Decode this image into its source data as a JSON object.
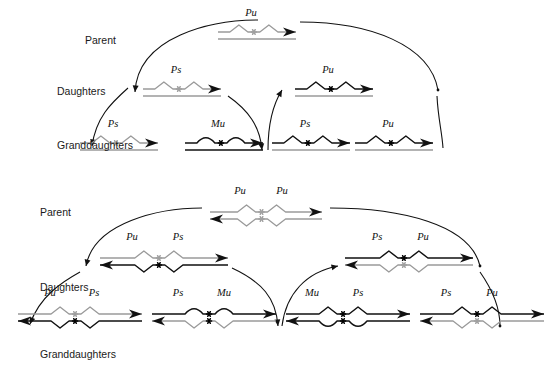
{
  "diagram": {
    "title_none": "",
    "colors": {
      "strand_dark": "#111111",
      "strand_light": "#9a9a9a",
      "background": "#ffffff",
      "text": "#1a1a1a"
    },
    "legend_symbols": {
      "Pu": "unmethylated-purine-site",
      "Ps": "methylated-site",
      "Mu": "mutated-site",
      "asterisk_dark": "black-asterisk-marker",
      "asterisk_light": "gray-asterisk-marker"
    }
  },
  "panels": [
    {
      "id": "panel-top",
      "row_labels": [
        {
          "text": "Parent",
          "x": 85,
          "y": 44
        },
        {
          "text": "Daughters",
          "x": 57,
          "y": 95
        },
        {
          "text": "Granddaughters",
          "x": 57,
          "y": 149
        }
      ],
      "generations": [
        {
          "name": "parent",
          "molecules": [
            {
              "id": "p1-parent-a",
              "x": 218,
              "y": 32,
              "width": 78,
              "labels": [
                {
                  "text": "Pu",
                  "dx": 33,
                  "dy": -16,
                  "tone": "dark"
                }
              ],
              "top_strand": {
                "tone": "light",
                "shape": "peaks",
                "marker": "light",
                "arrow": "right"
              },
              "bottom_strand": {
                "tone": "light",
                "shape": "flat",
                "arrow": "none"
              }
            }
          ]
        },
        {
          "name": "daughters",
          "molecules": [
            {
              "id": "p1-d-a",
              "x": 143,
              "y": 89,
              "width": 78,
              "labels": [
                {
                  "text": "Ps",
                  "dx": 33,
                  "dy": -16,
                  "tone": "dark"
                }
              ],
              "top_strand": {
                "tone": "light",
                "shape": "peaks",
                "marker": "light",
                "arrow": "right"
              },
              "bottom_strand": {
                "tone": "light",
                "shape": "flat",
                "arrow": "none"
              }
            },
            {
              "id": "p1-d-b",
              "x": 295,
              "y": 89,
              "width": 78,
              "labels": [
                {
                  "text": "Pu",
                  "dx": 33,
                  "dy": -16,
                  "tone": "dark"
                }
              ],
              "top_strand": {
                "tone": "dark",
                "shape": "peaks",
                "marker": "dark",
                "arrow": "right"
              },
              "bottom_strand": {
                "tone": "light",
                "shape": "flat",
                "arrow": "none"
              }
            }
          ]
        },
        {
          "name": "granddaughters",
          "molecules": [
            {
              "id": "p1-g-a",
              "x": 80,
              "y": 143,
              "width": 78,
              "labels": [
                {
                  "text": "Ps",
                  "dx": 33,
                  "dy": -16,
                  "tone": "dark"
                }
              ],
              "top_strand": {
                "tone": "light",
                "shape": "peaks",
                "marker": "light",
                "arrow": "right"
              },
              "bottom_strand": {
                "tone": "light",
                "shape": "flat",
                "arrow": "none"
              }
            },
            {
              "id": "p1-g-b",
              "x": 185,
              "y": 143,
              "width": 78,
              "labels": [
                {
                  "text": "Mu",
                  "dx": 33,
                  "dy": -16,
                  "tone": "dark"
                }
              ],
              "top_strand": {
                "tone": "dark",
                "shape": "bumps",
                "marker": "dark",
                "arrow": "right"
              },
              "bottom_strand": {
                "tone": "dark",
                "shape": "flat",
                "arrow": "none"
              }
            },
            {
              "id": "p1-g-c",
              "x": 272,
              "y": 143,
              "width": 78,
              "labels": [
                {
                  "text": "Ps",
                  "dx": 33,
                  "dy": -16,
                  "tone": "dark"
                }
              ],
              "top_strand": {
                "tone": "dark",
                "shape": "peaks",
                "marker": "dark",
                "arrow": "right"
              },
              "bottom_strand": {
                "tone": "light",
                "shape": "flat",
                "arrow": "none"
              }
            },
            {
              "id": "p1-g-d",
              "x": 355,
              "y": 143,
              "width": 78,
              "labels": [
                {
                  "text": "Pu",
                  "dx": 33,
                  "dy": -16,
                  "tone": "dark"
                }
              ],
              "top_strand": {
                "tone": "dark",
                "shape": "peaks",
                "marker": "dark",
                "arrow": "right"
              },
              "bottom_strand": {
                "tone": "light",
                "shape": "flat",
                "arrow": "none"
              }
            }
          ]
        }
      ],
      "arcs": [
        {
          "id": "p1-arc-1",
          "d": "M 135,92 C 138,36 212,20 258,20",
          "arrow_at": "start"
        },
        {
          "id": "p1-arc-2",
          "d": "M 300,22 C 370,22 430,45 438,90",
          "arrow_at": "end-dot"
        },
        {
          "id": "p1-arc-3",
          "d": "M 128,88 C 110,104 96,118 92,146",
          "arrow_at": "end"
        },
        {
          "id": "p1-arc-4",
          "d": "M 228,96 C 248,110 260,126 262,150",
          "arrow_at": "end"
        },
        {
          "id": "p1-arc-5",
          "d": "M 282,90 C 272,106 268,126 268,150",
          "arrow_at": "start-mirror"
        },
        {
          "id": "p1-arc-6",
          "d": "M 437,96 C 438,118 442,132 443,148",
          "arrow_at": "none"
        }
      ]
    },
    {
      "id": "panel-bottom",
      "row_labels": [
        {
          "text": "Parent",
          "x": 40,
          "y": 30
        },
        {
          "text": "Daughters",
          "x": 40,
          "y": 105
        },
        {
          "text": "Granddaughters",
          "x": 40,
          "y": 172
        }
      ],
      "generations": [
        {
          "name": "parent",
          "molecules": [
            {
              "id": "p2-parent-a",
              "x": 210,
              "y": 26,
              "width": 112,
              "labels": [
                {
                  "text": "Pu",
                  "dx": 30,
                  "dy": -18,
                  "tone": "dark"
                },
                {
                  "text": "Pu",
                  "dx": 72,
                  "dy": -18,
                  "tone": "dark"
                }
              ],
              "top_strand": {
                "tone": "light",
                "shape": "peaks",
                "marker": "light",
                "arrow": "right"
              },
              "bottom_strand": {
                "tone": "light",
                "shape": "valleys",
                "marker": "light",
                "arrow": "left"
              }
            }
          ]
        },
        {
          "name": "daughters",
          "molecules": [
            {
              "id": "p2-d-a",
              "x": 100,
              "y": 72,
              "width": 128,
              "labels": [
                {
                  "text": "Pu",
                  "dx": 32,
                  "dy": -18,
                  "tone": "dark"
                },
                {
                  "text": "Ps",
                  "dx": 78,
                  "dy": -18,
                  "tone": "dark"
                }
              ],
              "top_strand": {
                "tone": "light",
                "shape": "peaks",
                "marker": "light",
                "arrow": "right"
              },
              "bottom_strand": {
                "tone": "dark",
                "shape": "valleys",
                "marker": "dark",
                "arrow": "left"
              }
            },
            {
              "id": "p2-d-b",
              "x": 345,
              "y": 72,
              "width": 128,
              "labels": [
                {
                  "text": "Ps",
                  "dx": 32,
                  "dy": -18,
                  "tone": "dark"
                },
                {
                  "text": "Pu",
                  "dx": 78,
                  "dy": -18,
                  "tone": "dark"
                }
              ],
              "top_strand": {
                "tone": "dark",
                "shape": "peaks",
                "marker": "dark",
                "arrow": "right"
              },
              "bottom_strand": {
                "tone": "light",
                "shape": "valleys",
                "marker": "light",
                "arrow": "left"
              }
            }
          ]
        },
        {
          "name": "granddaughters",
          "molecules": [
            {
              "id": "p2-g-a",
              "x": 18,
              "y": 128,
              "width": 124,
              "labels": [
                {
                  "text": "Pu",
                  "dx": 32,
                  "dy": -18,
                  "tone": "dark"
                },
                {
                  "text": "Ps",
                  "dx": 76,
                  "dy": -18,
                  "tone": "dark"
                }
              ],
              "top_strand": {
                "tone": "light",
                "shape": "peaks",
                "marker": "light",
                "arrow": "right"
              },
              "bottom_strand": {
                "tone": "dark",
                "shape": "valleys",
                "marker": "dark",
                "arrow": "left"
              }
            },
            {
              "id": "p2-g-b",
              "x": 152,
              "y": 128,
              "width": 124,
              "labels": [
                {
                  "text": "Ps",
                  "dx": 26,
                  "dy": -18,
                  "tone": "dark"
                },
                {
                  "text": "Mu",
                  "dx": 72,
                  "dy": -18,
                  "tone": "dark"
                }
              ],
              "top_strand": {
                "tone": "dark",
                "shape": "bumps",
                "marker": "dark",
                "arrow": "right"
              },
              "bottom_strand": {
                "tone": "light",
                "shape": "valleys",
                "marker": "dark",
                "arrow": "left"
              }
            },
            {
              "id": "p2-g-c",
              "x": 286,
              "y": 128,
              "width": 124,
              "labels": [
                {
                  "text": "Mu",
                  "dx": 26,
                  "dy": -18,
                  "tone": "dark"
                },
                {
                  "text": "Ps",
                  "dx": 72,
                  "dy": -18,
                  "tone": "dark"
                }
              ],
              "top_strand": {
                "tone": "dark",
                "shape": "peaks",
                "marker": "dark",
                "arrow": "right"
              },
              "bottom_strand": {
                "tone": "dark",
                "shape": "bumps-down",
                "marker": "dark",
                "arrow": "left"
              }
            },
            {
              "id": "p2-g-d",
              "x": 420,
              "y": 128,
              "width": 124,
              "labels": [
                {
                  "text": "Ps",
                  "dx": 26,
                  "dy": -18,
                  "tone": "dark"
                },
                {
                  "text": "Pu",
                  "dx": 72,
                  "dy": -18,
                  "tone": "dark"
                }
              ],
              "top_strand": {
                "tone": "dark",
                "shape": "peaks",
                "marker": "dark",
                "arrow": "right"
              },
              "bottom_strand": {
                "tone": "light",
                "shape": "valleys",
                "marker": "light",
                "arrow": "left"
              }
            }
          ]
        }
      ],
      "arcs": [
        {
          "id": "p2-arc-1",
          "d": "M 86,80 C 94,36 160,22 202,22",
          "arrow_at": "start"
        },
        {
          "id": "p2-arc-2",
          "d": "M 330,22 C 400,22 470,38 480,80",
          "arrow_at": "end-dot"
        },
        {
          "id": "p2-arc-3",
          "d": "M 80,86 C 62,96 40,110 30,138",
          "arrow_at": "end"
        },
        {
          "id": "p2-arc-4",
          "d": "M 232,82 C 262,96 276,112 278,140",
          "arrow_at": "end"
        },
        {
          "id": "p2-arc-5",
          "d": "M 338,80 C 306,86 286,108 282,140",
          "arrow_at": "start"
        },
        {
          "id": "p2-arc-6",
          "d": "M 480,86 C 494,106 500,122 500,140",
          "arrow_at": "end-dot"
        }
      ]
    }
  ]
}
